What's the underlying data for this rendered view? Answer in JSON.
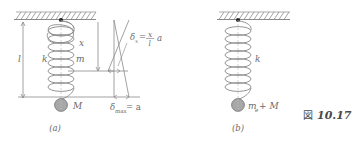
{
  "figure": {
    "number_kanji": "図",
    "number": "10.17",
    "background_color": "#ffffff",
    "line_color": "#8a8a8a",
    "text_color": "#6a6a6a",
    "mass_fill_color": "#a8a8a8",
    "anchor_color": "#222222"
  },
  "panel_a": {
    "caption": "(a)",
    "labels": {
      "length": "l",
      "spring_constant": "k",
      "spring_mass": "m",
      "hanging_mass": "M",
      "coordinate": "x"
    },
    "annotations": {
      "delta_x_symbol": "δ",
      "delta_x_subscript": "x",
      "delta_x_equals": "=",
      "delta_x_numerator": "x",
      "delta_x_denominator": "l",
      "delta_x_factor": "a",
      "delta_max_symbol": "δ",
      "delta_max_subscript": "max",
      "delta_max_equals": "= a"
    },
    "spring_coils": 8
  },
  "panel_b": {
    "caption": "(b)",
    "labels": {
      "spring_constant": "k",
      "effective_mass_symbol": "m",
      "effective_mass_subscript": "e",
      "effective_mass_plus": "+ M"
    },
    "spring_coils": 8
  }
}
